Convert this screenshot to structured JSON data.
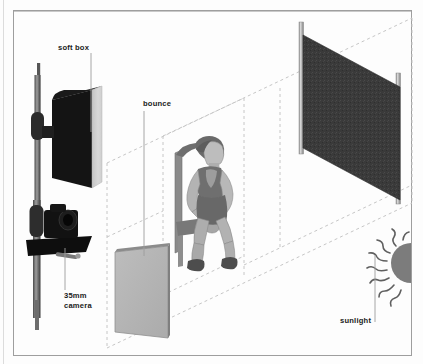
{
  "diagram": {
    "type": "photographic lighting plan",
    "view": "three-quarter perspective",
    "background_color": "#fdfdfd",
    "frame_color": "#9b9b9b",
    "guide_color": "#c8c8c8"
  },
  "labels": {
    "softbox": "soft box",
    "bounce": "bounce",
    "camera": "35mm\ncamera",
    "sunlight": "sunlight"
  },
  "elements": [
    {
      "name": "soft-box",
      "label": "soft box",
      "colors": {
        "body": "#151515",
        "front_panel": "#d2d2d2",
        "top": "#2a2a2a"
      },
      "position": "upper-left, mounted on light stand"
    },
    {
      "name": "light-stand",
      "label": "",
      "colors": {
        "pole": "#5a5a5a",
        "clamp": "#2d2d2d"
      },
      "position": "far left, vertical"
    },
    {
      "name": "35mm-camera",
      "label": "35mm camera",
      "colors": {
        "body": "#111111",
        "plate": "#0d0d0d"
      },
      "position": "left, mounted below soft box on the same stand"
    },
    {
      "name": "bounce-card",
      "label": "bounce",
      "colors": {
        "face": "#b6b6b6",
        "edge": "#8e8e8e"
      },
      "position": "lower-centre-left, facing the subject"
    },
    {
      "name": "seated-subject",
      "label": "",
      "colors": {
        "skin": "#b9b9b9",
        "clothing": "#6e6e6e",
        "shoes": "#4a4a4a"
      },
      "position": "centre, seated on a chair leaning forward"
    },
    {
      "name": "chair",
      "label": "",
      "colors": {
        "frame": "#8d8d8d",
        "shadow": "#6a6a6a"
      },
      "position": "centre, beneath subject"
    },
    {
      "name": "backdrop",
      "label": "",
      "colors": {
        "cloth": "#3a3a3a",
        "pole": "#c9c9c9"
      },
      "position": "right rear, dark cloth on two stands"
    },
    {
      "name": "sun",
      "label": "sunlight",
      "colors": {
        "disc": "#7d7d7d",
        "rays": "#555555"
      },
      "position": "far right, half disc clipped at frame edge with wavy rays"
    }
  ],
  "guides": {
    "style": "dashed",
    "color": "#c8c8c8",
    "description": "Dashed perspective lines marking the floor plane and light paths between camera, bounce, subject and backdrop."
  }
}
